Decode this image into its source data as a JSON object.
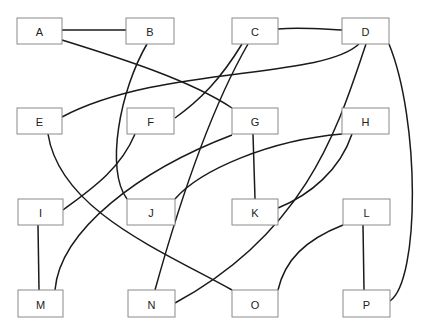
{
  "diagram": {
    "type": "graph",
    "colors": {
      "edge": "#1a1a1a",
      "node_border": "#8a8a8a",
      "node_fill": "#ffffff",
      "label": "#222222"
    },
    "nodes": [
      {
        "id": "A",
        "label": "A",
        "x": 17,
        "y": 18,
        "w": 45,
        "h": 26
      },
      {
        "id": "B",
        "label": "B",
        "x": 126,
        "y": 18,
        "w": 48,
        "h": 26
      },
      {
        "id": "C",
        "label": "C",
        "x": 232,
        "y": 18,
        "w": 46,
        "h": 26
      },
      {
        "id": "D",
        "label": "D",
        "x": 342,
        "y": 18,
        "w": 47,
        "h": 26
      },
      {
        "id": "E",
        "label": "E",
        "x": 17,
        "y": 108,
        "w": 45,
        "h": 26
      },
      {
        "id": "F",
        "label": "F",
        "x": 127,
        "y": 108,
        "w": 47,
        "h": 26
      },
      {
        "id": "G",
        "label": "G",
        "x": 232,
        "y": 108,
        "w": 46,
        "h": 26
      },
      {
        "id": "H",
        "label": "H",
        "x": 342,
        "y": 108,
        "w": 47,
        "h": 26
      },
      {
        "id": "I",
        "label": "I",
        "x": 18,
        "y": 199,
        "w": 45,
        "h": 26
      },
      {
        "id": "J",
        "label": "J",
        "x": 127,
        "y": 199,
        "w": 48,
        "h": 26
      },
      {
        "id": "K",
        "label": "K",
        "x": 232,
        "y": 199,
        "w": 46,
        "h": 26
      },
      {
        "id": "L",
        "label": "L",
        "x": 343,
        "y": 199,
        "w": 47,
        "h": 26
      },
      {
        "id": "M",
        "label": "M",
        "x": 18,
        "y": 290,
        "w": 45,
        "h": 27
      },
      {
        "id": "N",
        "label": "N",
        "x": 128,
        "y": 290,
        "w": 47,
        "h": 27
      },
      {
        "id": "O",
        "label": "O",
        "x": 232,
        "y": 290,
        "w": 46,
        "h": 27
      },
      {
        "id": "P",
        "label": "P",
        "x": 343,
        "y": 290,
        "w": 47,
        "h": 27
      }
    ],
    "edges": [
      {
        "from": "A",
        "to": "B",
        "d": "M62,30 L126,30"
      },
      {
        "from": "A",
        "to": "G",
        "d": "M62,40 C120,58 190,80 232,108"
      },
      {
        "from": "B",
        "to": "J",
        "d": "M147,44 C120,90 105,170 127,199"
      },
      {
        "from": "C",
        "to": "D",
        "d": "M278,29 C300,27 320,29 342,30"
      },
      {
        "from": "C",
        "to": "F",
        "d": "M242,44 C220,80 200,100 175,118"
      },
      {
        "from": "C",
        "to": "N",
        "d": "M248,44 C210,110 180,200 155,290"
      },
      {
        "from": "D",
        "to": "E",
        "d": "M359,44 C320,80 160,65 62,117"
      },
      {
        "from": "D",
        "to": "N",
        "d": "M366,44 C340,120 310,230 175,303"
      },
      {
        "from": "D",
        "to": "P",
        "d": "M389,44 C420,120 420,280 390,301"
      },
      {
        "from": "E",
        "to": "O",
        "d": "M48,134 C60,210 160,250 232,290"
      },
      {
        "from": "F",
        "to": "I",
        "d": "M135,134 C120,170 90,190 63,210"
      },
      {
        "from": "G",
        "to": "K",
        "d": "M253,134 L255,199"
      },
      {
        "from": "G",
        "to": "M",
        "d": "M232,135 C140,170 60,230 55,290"
      },
      {
        "from": "H",
        "to": "J",
        "d": "M342,134 C270,140 200,170 175,199"
      },
      {
        "from": "H",
        "to": "K",
        "d": "M352,134 C340,170 310,195 278,208"
      },
      {
        "from": "I",
        "to": "M",
        "d": "M38,225 L39,290"
      },
      {
        "from": "L",
        "to": "O",
        "d": "M343,225 C305,240 285,260 278,290"
      },
      {
        "from": "L",
        "to": "P",
        "d": "M363,225 L364,290"
      }
    ]
  }
}
